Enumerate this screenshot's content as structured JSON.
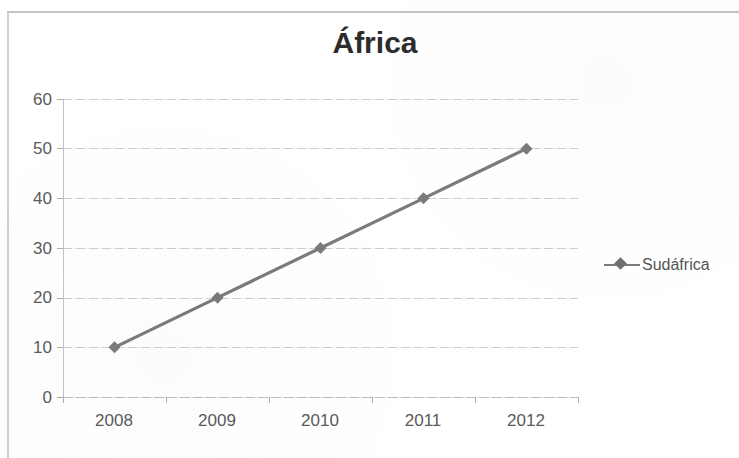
{
  "chart_data": {
    "type": "line",
    "title": "África",
    "xlabel": "",
    "ylabel": "",
    "categories": [
      "2008",
      "2009",
      "2010",
      "2011",
      "2012"
    ],
    "series": [
      {
        "name": "Sudáfrica",
        "values": [
          10,
          20,
          30,
          40,
          50
        ],
        "color": "#7b7b7b",
        "marker": "diamond"
      }
    ],
    "ylim": [
      0,
      60
    ],
    "y_ticks": [
      "0",
      "10",
      "20",
      "30",
      "40",
      "50",
      "60"
    ],
    "grid": true,
    "legend_position": "right",
    "title_color": "#2c2c2c",
    "axis_label_color": "#5a5a5a",
    "gridline_color": "#c9cfd8"
  },
  "legend": {
    "entries": [
      {
        "label": "Sudáfrica",
        "marker_name": "diamond-line-marker"
      }
    ]
  }
}
